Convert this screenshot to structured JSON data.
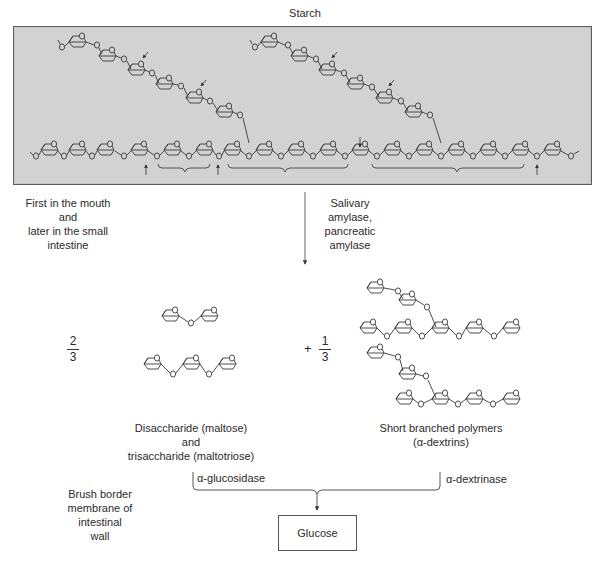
{
  "title": "Starch",
  "process_note": {
    "lines": [
      "First in the mouth",
      "and",
      "later in the small",
      "intestine"
    ]
  },
  "enzymes_step1": {
    "lines": [
      "Salivary",
      "amylase,",
      "pancreatic",
      "amylase"
    ]
  },
  "fractions": {
    "left": {
      "numerator": "2",
      "denominator": "3"
    },
    "right": {
      "plus": "+",
      "numerator": "1",
      "denominator": "3"
    }
  },
  "products": {
    "left": {
      "lines": [
        "Disaccharide (maltose)",
        "and",
        "trisaccharide (maltotriose)"
      ]
    },
    "right": {
      "lines": [
        "Short branched polymers",
        "(α-dextrins)"
      ]
    }
  },
  "enzymes_step2": {
    "left": "α-glucosidase",
    "right": "α-dextrinase"
  },
  "location_note": {
    "lines": [
      "Brush border",
      "membrane of",
      "intestinal",
      "wall"
    ]
  },
  "final_product": "Glucose",
  "atom_label": "O",
  "colors": {
    "panel_fill": "#d2d2d2",
    "panel_border": "#5e5e5e",
    "line": "#3a3a3a"
  }
}
